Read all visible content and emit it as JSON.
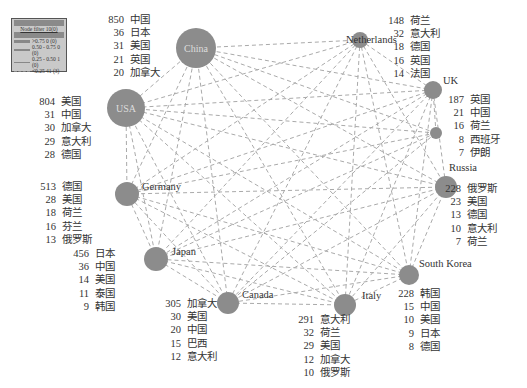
{
  "legend": {
    "title": "",
    "subtitle": "Node filter 10(0)",
    "header": "",
    "rows": [
      {
        "range": ">0.75",
        "value": "0",
        "count": "(0)",
        "style": "solid-thick"
      },
      {
        "range": "0.50 - 0.75",
        "value": "0",
        "count": "(0)",
        "style": "solid"
      },
      {
        "range": "0.25 - 0.50",
        "value": "1",
        "count": "(0)",
        "style": "solid-thin"
      },
      {
        "range": "<0.25",
        "value": "41",
        "count": "(3)",
        "style": "dashed"
      }
    ]
  },
  "nodes": [
    {
      "id": "china",
      "label": "China",
      "x": 196,
      "y": 48,
      "r": 20,
      "label_inside": true,
      "list_pos": {
        "x": 100,
        "y": 13
      },
      "list": [
        [
          "850",
          "中国"
        ],
        [
          "36",
          "日本"
        ],
        [
          "31",
          "美国"
        ],
        [
          "21",
          "英国"
        ],
        [
          "20",
          "加拿大"
        ]
      ]
    },
    {
      "id": "netherlands",
      "label": "Netherlands",
      "x": 360,
      "y": 40,
      "r": 8,
      "label_pos": {
        "x": 346,
        "y": 41
      },
      "list_pos": {
        "x": 380,
        "y": 14
      },
      "list": [
        [
          "148",
          "荷兰"
        ],
        [
          "32",
          "意大利"
        ],
        [
          "18",
          "德国"
        ],
        [
          "16",
          "英国"
        ],
        [
          "14",
          "法国"
        ]
      ]
    },
    {
      "id": "uk",
      "label": "UK",
      "x": 433,
      "y": 90,
      "r": 9,
      "label_pos": {
        "x": 443,
        "y": 82
      },
      "list_pos": {
        "x": 440,
        "y": 93
      },
      "list": [
        [
          "187",
          "英国"
        ],
        [
          "21",
          "中国"
        ],
        [
          "16",
          "荷兰"
        ],
        [
          "8",
          "西班牙"
        ],
        [
          "7",
          "伊朗"
        ]
      ]
    },
    {
      "id": "spain",
      "label": "",
      "x": 436,
      "y": 133,
      "r": 6
    },
    {
      "id": "russia",
      "label": "Russia",
      "x": 446,
      "y": 187,
      "r": 11,
      "label_pos": {
        "x": 449,
        "y": 169
      },
      "list_pos": {
        "x": 437,
        "y": 182
      },
      "list": [
        [
          "228",
          "俄罗斯"
        ],
        [
          "23",
          "美国"
        ],
        [
          "13",
          "德国"
        ],
        [
          "10",
          "意大利"
        ],
        [
          "7",
          "荷兰"
        ]
      ]
    },
    {
      "id": "south_korea",
      "label": "South Korea",
      "x": 409,
      "y": 275,
      "r": 10,
      "label_pos": {
        "x": 419,
        "y": 265
      },
      "list_pos": {
        "x": 390,
        "y": 287
      },
      "list": [
        [
          "228",
          "韩国"
        ],
        [
          "15",
          "中国"
        ],
        [
          "10",
          "美国"
        ],
        [
          "9",
          "日本"
        ],
        [
          "8",
          "德国"
        ]
      ]
    },
    {
      "id": "italy",
      "label": "Italy",
      "x": 345,
      "y": 305,
      "r": 11,
      "label_pos": {
        "x": 362,
        "y": 297
      },
      "list_pos": {
        "x": 290,
        "y": 313
      },
      "list": [
        [
          "291",
          "意大利"
        ],
        [
          "32",
          "荷兰"
        ],
        [
          "29",
          "美国"
        ],
        [
          "12",
          "加拿大"
        ],
        [
          "10",
          "俄罗斯"
        ]
      ]
    },
    {
      "id": "canada",
      "label": "Canada",
      "x": 228,
      "y": 303,
      "r": 11,
      "label_pos": {
        "x": 242,
        "y": 296
      },
      "list_pos": {
        "x": 157,
        "y": 297
      },
      "list": [
        [
          "305",
          "加拿大"
        ],
        [
          "30",
          "美国"
        ],
        [
          "20",
          "中国"
        ],
        [
          "15",
          "巴西"
        ],
        [
          "12",
          "意大利"
        ]
      ]
    },
    {
      "id": "japan",
      "label": "Japan",
      "x": 156,
      "y": 259,
      "r": 12,
      "label_pos": {
        "x": 172,
        "y": 253
      },
      "list_pos": {
        "x": 65,
        "y": 247
      },
      "list": [
        [
          "456",
          "日本"
        ],
        [
          "36",
          "中国"
        ],
        [
          "14",
          "美国"
        ],
        [
          "11",
          "泰国"
        ],
        [
          "9",
          "韩国"
        ]
      ]
    },
    {
      "id": "germany",
      "label": "Germany",
      "x": 127,
      "y": 194,
      "r": 12,
      "label_pos": {
        "x": 142,
        "y": 188
      },
      "list_pos": {
        "x": 32,
        "y": 180
      },
      "list": [
        [
          "513",
          "德国"
        ],
        [
          "28",
          "美国"
        ],
        [
          "18",
          "荷兰"
        ],
        [
          "16",
          "芬兰"
        ],
        [
          "13",
          "俄罗斯"
        ]
      ]
    },
    {
      "id": "usa",
      "label": "USA",
      "x": 126,
      "y": 108,
      "r": 19,
      "label_inside": true,
      "list_pos": {
        "x": 31,
        "y": 95
      },
      "list": [
        [
          "804",
          "美国"
        ],
        [
          "31",
          "中国"
        ],
        [
          "30",
          "加拿大"
        ],
        [
          "29",
          "意大利"
        ],
        [
          "28",
          "德国"
        ]
      ]
    }
  ],
  "colors": {
    "node": "#8c8c8c",
    "edge": "#aaaaaa",
    "text": "#333333"
  }
}
